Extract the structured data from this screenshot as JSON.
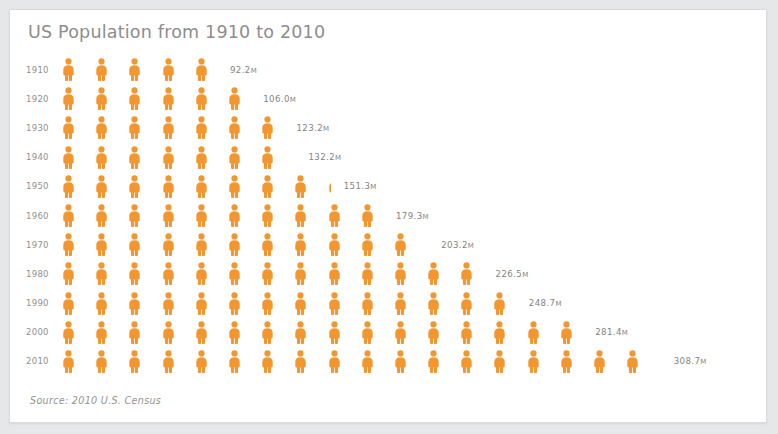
{
  "card": {
    "title": "US Population from 1910 to 2010",
    "source": "Source: 2010 U.S. Census",
    "accent_color": "#f2972f",
    "title_color": "#8d8d8d",
    "label_color": "#8f8f8f",
    "background_color": "#ffffff",
    "page_color": "#e6e7e9"
  },
  "chart_data": {
    "type": "pictogram",
    "title": "US Population from 1910 to 2010",
    "xlabel": "",
    "ylabel": "",
    "unit": "M",
    "unit_note": "millions of people",
    "icon_value": 16.7,
    "icon_symbol": "person",
    "legend": [],
    "grid": false,
    "source": "Source: 2010 U.S. Census",
    "categories": [
      "1910",
      "1920",
      "1930",
      "1940",
      "1950",
      "1960",
      "1970",
      "1980",
      "1990",
      "2000",
      "2010"
    ],
    "values": [
      92.2,
      106.0,
      123.2,
      132.2,
      151.3,
      179.3,
      203.2,
      226.5,
      248.7,
      281.4,
      308.7
    ],
    "value_labels": [
      "92.2M",
      "106.0M",
      "123.2M",
      "132.2M",
      "151.3M",
      "179.3M",
      "203.2M",
      "226.5M",
      "248.7M",
      "281.4M",
      "308.7M"
    ],
    "rows": [
      {
        "year": "1910",
        "value": 92.2,
        "label": "92.2",
        "unit": "M",
        "full_icons": 5,
        "partial": 0.0
      },
      {
        "year": "1920",
        "value": 106.0,
        "label": "106.0",
        "unit": "M",
        "full_icons": 6,
        "partial": 0.0
      },
      {
        "year": "1930",
        "value": 123.2,
        "label": "123.2",
        "unit": "M",
        "full_icons": 7,
        "partial": 0.0
      },
      {
        "year": "1940",
        "value": 132.2,
        "label": "132.2",
        "unit": "M",
        "full_icons": 7,
        "partial": 0.18
      },
      {
        "year": "1950",
        "value": 151.3,
        "label": "151.3",
        "unit": "M",
        "full_icons": 8,
        "partial": 0.3
      },
      {
        "year": "1960",
        "value": 179.3,
        "label": "179.3",
        "unit": "M",
        "full_icons": 10,
        "partial": 0.0
      },
      {
        "year": "1970",
        "value": 203.2,
        "label": "203.2",
        "unit": "M",
        "full_icons": 11,
        "partial": 0.18
      },
      {
        "year": "1980",
        "value": 226.5,
        "label": "226.5",
        "unit": "M",
        "full_icons": 13,
        "partial": 0.0
      },
      {
        "year": "1990",
        "value": 248.7,
        "label": "248.7",
        "unit": "M",
        "full_icons": 14,
        "partial": 0.0
      },
      {
        "year": "2000",
        "value": 281.4,
        "label": "281.4",
        "unit": "M",
        "full_icons": 16,
        "partial": 0.0
      },
      {
        "year": "2010",
        "value": 308.7,
        "label": "308.7",
        "unit": "M",
        "full_icons": 18,
        "partial": 0.18
      }
    ]
  }
}
